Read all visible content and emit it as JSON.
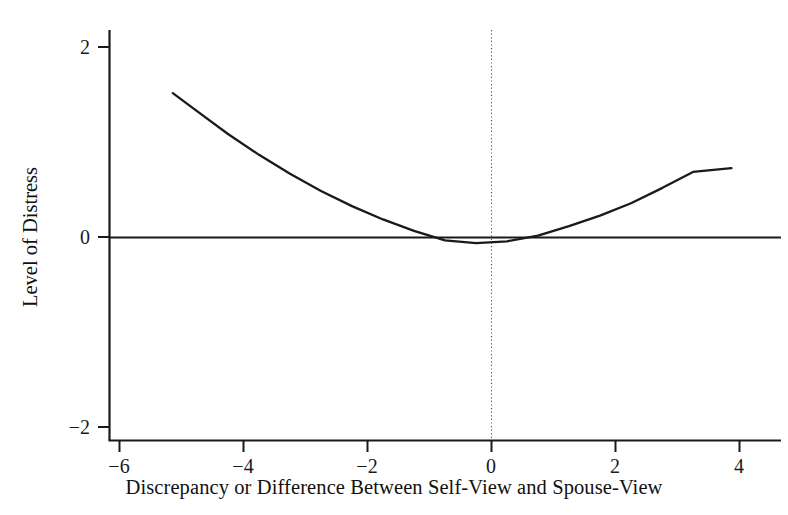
{
  "chart_data": {
    "type": "line",
    "title": "",
    "xlabel": "Discrepancy or Difference Between Self-View and Spouse-View",
    "ylabel": "Level of Distress",
    "xlim": [
      -6.6,
      4.7
    ],
    "ylim": [
      -2.2,
      2.2
    ],
    "grid": false,
    "legend": "none",
    "xticks": [
      -6,
      -4,
      -2,
      0,
      2,
      4
    ],
    "xtick_labels": [
      "−6",
      "−4",
      "−2",
      "0",
      "2",
      "4"
    ],
    "yticks": [
      2,
      0,
      -2
    ],
    "ytick_labels": [
      "2",
      "0",
      "−2"
    ],
    "annotations": [
      {
        "name": "zero-reference-line",
        "kind": "horizontal-line",
        "y": 0,
        "style": "solid"
      },
      {
        "name": "zero-discrepancy-line",
        "kind": "vertical-line",
        "x": 0,
        "style": "dotted"
      }
    ],
    "series": [
      {
        "name": "distress-curve",
        "style": "solid",
        "color": "#1a1a1a",
        "shape": "quadratic (U-shaped)",
        "vertex": [
          -0.17,
          -0.06
        ],
        "x": [
          -5.14,
          -4.75,
          -4.25,
          -3.75,
          -3.25,
          -2.75,
          -2.25,
          -1.75,
          -1.25,
          -0.75,
          -0.25,
          0.25,
          0.75,
          1.25,
          1.75,
          2.25,
          2.75,
          3.25,
          3.87
        ],
        "y": [
          1.52,
          1.33,
          1.09,
          0.87,
          0.67,
          0.49,
          0.33,
          0.19,
          0.07,
          -0.03,
          -0.06,
          -0.04,
          0.02,
          0.12,
          0.23,
          0.36,
          0.52,
          0.69,
          0.73
        ]
      }
    ]
  },
  "axes": {
    "x_axis_name": "x-axis",
    "y_axis_name": "y-axis"
  }
}
